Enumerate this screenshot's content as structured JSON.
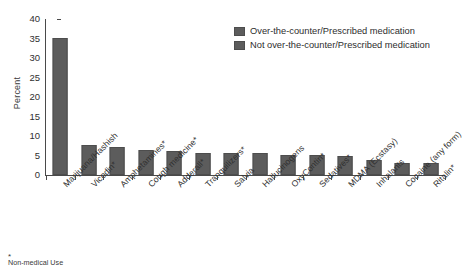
{
  "chart_data": {
    "type": "bar",
    "title": "",
    "xlabel": "",
    "ylabel": "Percent",
    "ylim": [
      0,
      40
    ],
    "ytick_values": [
      40,
      35,
      30,
      25,
      20,
      15,
      10,
      5,
      0
    ],
    "ytick_labels": [
      "40",
      "35",
      "30",
      "25",
      "20",
      "15",
      "10",
      "5",
      "0"
    ],
    "grid": false,
    "legend_position": "upper-right",
    "categories": [
      "Marijuana/Hashish",
      "Vicodin*",
      "Amphetamines*",
      "Cough medicine*",
      "Adderall*",
      "Tranquilizers*",
      "Salvia",
      "Hallucinogens",
      "OxyContin*",
      "Sedatives*",
      "MDMA (Ecstasy)",
      "Inhalants",
      "Cocaine (any form)",
      "Ritalin*"
    ],
    "values": [
      35.1,
      7.7,
      7.3,
      6.4,
      6.2,
      5.6,
      5.6,
      5.6,
      5.2,
      5.2,
      4.8,
      3.9,
      3.2,
      3.1
    ],
    "bar_series_type": [
      "not_otc",
      "otc",
      "otc",
      "otc",
      "otc",
      "otc",
      "not_otc",
      "not_otc",
      "otc",
      "otc",
      "not_otc",
      "not_otc",
      "not_otc",
      "otc"
    ],
    "series": [
      {
        "name": "Over-the-counter/Prescribed medication",
        "color": "#5c5c5c"
      },
      {
        "name": "Not over-the-counter/Prescribed medication",
        "color": "#5c5c5c"
      }
    ]
  },
  "legend": {
    "items": [
      {
        "label": "Over-the-counter/Prescribed medication",
        "color": "#5c5c5c"
      },
      {
        "label": "Not over-the-counter/Prescribed medication",
        "color": "#5c5c5c"
      }
    ]
  },
  "footnote": {
    "marker": "*",
    "text": "Non-medical Use"
  },
  "colors": {
    "bar": "#5c5c5c",
    "bar_border": "#4d4d4d",
    "axis": "#4a4a4a",
    "text": "#2f2f2f",
    "background": "#ffffff"
  }
}
